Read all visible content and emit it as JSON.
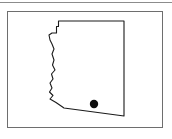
{
  "figure": {
    "kind": "map",
    "title": "",
    "caption": "",
    "background_color": "#ffffff"
  },
  "top_rule": {
    "color": "#8c8c8c",
    "visible": true
  },
  "map_frame": {
    "border_color": "#6e6e6e",
    "fill_color": "#ffffff",
    "x": 7,
    "y": 11,
    "width": 156,
    "height": 117
  },
  "map": {
    "region_name": "Arizona",
    "outline_color": "#1a1a1a",
    "fill_color": "#ffffff",
    "outline_path": "M 58.5,21 L 124,21 L 124,116 L 64,108 L 56,102.5 L 50,99 L 53,95.5 L 49.5,92 L 52,88 L 50,83 L 53,79 L 51.5,74 L 55,70 L 52.5,65 L 54,60 L 52,54 L 54,49 L 52,44 L 50,40 L 49,35 L 52,33 L 56.5,33 L 56.5,26.5 L 58.5,26.5 Z",
    "markers": [
      {
        "name": "city-marker",
        "label": "",
        "cx": 94,
        "cy": 104,
        "r": 4.2,
        "color": "#0d0d0d"
      }
    ]
  },
  "chart_data": {
    "type": "map",
    "title": "",
    "xlabel": "",
    "ylabel": "",
    "regions": [
      {
        "name": "Arizona",
        "outline_color": "#1a1a1a",
        "fill_color": "#ffffff"
      }
    ],
    "points": [
      {
        "label": "",
        "x": 94,
        "y": 104,
        "marker": "filled-circle",
        "color": "#0d0d0d",
        "size": 8.4
      }
    ],
    "legend": [],
    "grid": false
  }
}
